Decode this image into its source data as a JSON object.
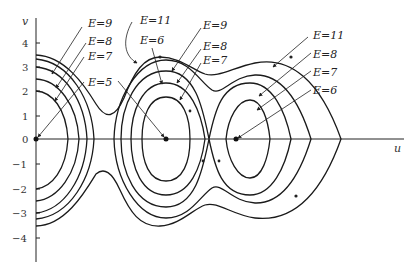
{
  "figure": {
    "axes": {
      "x_label": "u",
      "y_label": "v",
      "y_ticks": [
        "4",
        "3",
        "2",
        "1",
        "0",
        "−1",
        "−2",
        "−3",
        "−4"
      ]
    },
    "labels": {
      "left_e9": "E=9",
      "left_e8": "E=8",
      "left_e7": "E=7",
      "left_e5": "E=5",
      "mid_e11": "E=11",
      "mid_e6": "E=6",
      "midright_e9": "E=9",
      "midright_e8": "E=8",
      "midright_e7": "E=7",
      "right_e11": "E=11",
      "right_e8": "E=8",
      "right_e7": "E=7",
      "right_e6": "E=6"
    },
    "equilibria": [
      {
        "name": "origin",
        "u": 0,
        "v": 0
      },
      {
        "name": "center-1",
        "u_px": 166,
        "v": 0
      },
      {
        "name": "center-2",
        "u_px": 236,
        "v": 0
      }
    ]
  }
}
